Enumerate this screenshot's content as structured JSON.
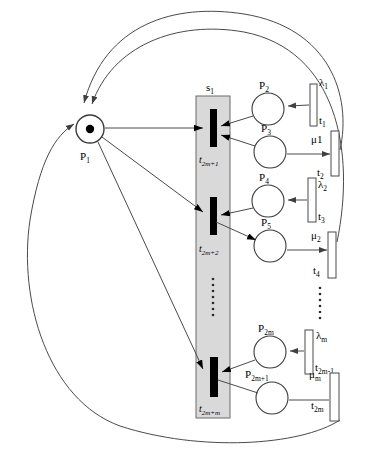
{
  "figure": {
    "colors": {
      "line": "#4a4a4a",
      "fill_bar": "#d9d9d9",
      "transition_black": "#000000",
      "background": "#ffffff",
      "token": "#000000"
    },
    "place_p1": {
      "label": "P",
      "label_sub": "1",
      "has_token": true
    },
    "subnet": {
      "label": "s",
      "label_sub": "1"
    },
    "blocks": [
      {
        "transition_label": "t",
        "transition_sub": "2m+1",
        "place_top": {
          "label": "P",
          "sub": "2"
        },
        "place_bottom": {
          "label": "P",
          "sub": "3"
        },
        "rate_in": {
          "label": "λ",
          "sub": "1"
        },
        "trans_in": {
          "label": "t",
          "sub": "1"
        },
        "rate_out": {
          "label": "μ1",
          "sub": ""
        },
        "trans_out": {
          "label": "t",
          "sub": "2"
        }
      },
      {
        "transition_label": "t",
        "transition_sub": "2m+2",
        "place_top": {
          "label": "P",
          "sub": "4"
        },
        "place_bottom": {
          "label": "P",
          "sub": "5"
        },
        "rate_in": {
          "label": "λ",
          "sub": "2"
        },
        "trans_in": {
          "label": "t",
          "sub": "3"
        },
        "rate_out": {
          "label": "μ",
          "sub": "2"
        },
        "trans_out": {
          "label": "t",
          "sub": "4"
        }
      },
      {
        "transition_label": "t",
        "transition_sub": "2m+m",
        "place_top": {
          "label": "P",
          "sub": "2m"
        },
        "place_bottom": {
          "label": "P",
          "sub": "2m+1"
        },
        "rate_in": {
          "label": "λ",
          "sub": "m"
        },
        "trans_in": {
          "label": "t",
          "sub": "2m-1"
        },
        "rate_out": {
          "label": "μ",
          "sub": "m"
        },
        "trans_out": {
          "label": "t",
          "sub": "2m"
        }
      }
    ],
    "ellipsis": {
      "inside_bar": "⋮",
      "right_column": "⋮"
    }
  }
}
